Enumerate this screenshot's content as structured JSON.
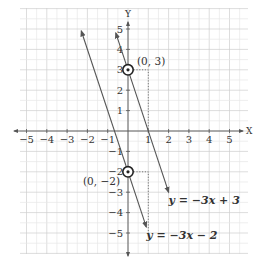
{
  "chart_data": {
    "type": "line",
    "title": "",
    "xlabel": "X",
    "ylabel": "Y",
    "xlim": [
      -5,
      5
    ],
    "ylim": [
      -5,
      5
    ],
    "grid": true,
    "x_ticks": [
      -5,
      -4,
      -3,
      -2,
      -1,
      1,
      2,
      3,
      4,
      5
    ],
    "y_ticks": [
      -5,
      -4,
      -3,
      -2,
      -1,
      1,
      2,
      3,
      4,
      5
    ],
    "series": [
      {
        "name": "y = -3x + 3",
        "slope": -3,
        "intercept": 3,
        "x_range": [
          0.6667,
          2.3
        ],
        "drawn_from": [
          -0.6,
          4.8
        ],
        "drawn_to": [
          2.0,
          -3.0
        ],
        "highlight_point": {
          "x": 0,
          "y": 3,
          "label": "(0, 3)"
        },
        "rise_run_guide": {
          "from": [
            0,
            3
          ],
          "corner": [
            1,
            3
          ],
          "to": [
            1,
            0
          ]
        }
      },
      {
        "name": "y = -3x - 2",
        "slope": -3,
        "intercept": -2,
        "drawn_from": [
          -2.3,
          4.9
        ],
        "drawn_to": [
          0.9,
          -4.7
        ],
        "highlight_point": {
          "x": 0,
          "y": -2,
          "label": "(0, −2)"
        },
        "rise_run_guide": {
          "from": [
            0,
            -2
          ],
          "corner": [
            1,
            -2
          ],
          "to": [
            1,
            -5
          ]
        }
      }
    ],
    "equation_labels": [
      {
        "text": "y = −3x + 3",
        "x": 2.0,
        "y": -3.6
      },
      {
        "text": "y = −3x − 2",
        "x": 0.9,
        "y": -5.3
      }
    ]
  },
  "colors": {
    "grid_minor": "#e6e6e6",
    "grid_major": "#cfcfcf",
    "axis": "#555555",
    "line": "#555555",
    "guide": "#777777"
  }
}
